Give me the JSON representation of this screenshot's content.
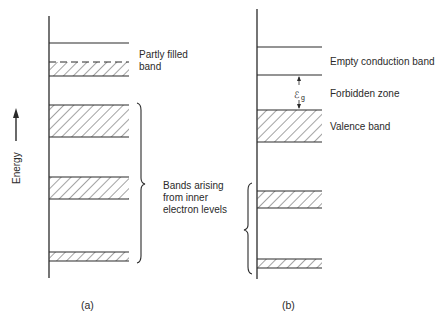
{
  "diagram": {
    "axis_label": "Energy",
    "panel_a": {
      "caption": "(a)",
      "bands": [
        {
          "name": "top-level-line",
          "type": "line",
          "y": 43
        },
        {
          "name": "partly-filled-band",
          "type": "partial",
          "y1": 62,
          "y2": 76
        },
        {
          "name": "inner-band-1",
          "type": "filled",
          "y1": 105,
          "y2": 137
        },
        {
          "name": "inner-band-2",
          "type": "filled",
          "y1": 177,
          "y2": 199
        },
        {
          "name": "inner-band-3",
          "type": "filled",
          "y1": 252,
          "y2": 261
        }
      ],
      "labels": {
        "partly_filled_line1": "Partly filled",
        "partly_filled_line2": "band",
        "inner_line1": "Bands arising",
        "inner_line2": "from inner",
        "inner_line3": "electron levels"
      }
    },
    "panel_b": {
      "caption": "(b)",
      "bands": [
        {
          "name": "conduction-band-top",
          "type": "line",
          "y": 47
        },
        {
          "name": "conduction-band-bottom",
          "type": "line",
          "y": 75
        },
        {
          "name": "valence-band",
          "type": "filled",
          "y1": 110,
          "y2": 142
        },
        {
          "name": "inner-band-1",
          "type": "filled",
          "y1": 191,
          "y2": 208
        },
        {
          "name": "inner-band-2",
          "type": "filled",
          "y1": 259,
          "y2": 268
        }
      ],
      "labels": {
        "conduction": "Empty conduction band",
        "forbidden": "Forbidden zone",
        "valence": "Valence band",
        "gap_symbol": "ℰ",
        "gap_subscript": "g"
      }
    },
    "colors": {
      "line": "#2a2a2a",
      "hatch": "#555555",
      "text": "#2a2a2a"
    }
  }
}
